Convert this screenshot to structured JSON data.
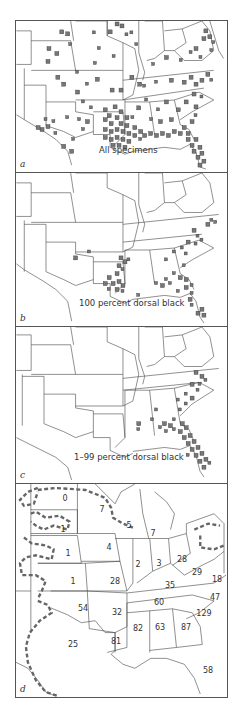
{
  "figure": {
    "colors": {
      "border": "#555555",
      "state_line": "#444444",
      "marker_fill": "#777777",
      "marker_stroke": "#333333",
      "range_dash": "#666666",
      "background": "#ffffff"
    },
    "panels": [
      {
        "letter": "a",
        "caption": "All specimens"
      },
      {
        "letter": "b",
        "caption": "100 percent dorsal black"
      },
      {
        "letter": "c",
        "caption": "1–99 percent dorsal black"
      },
      {
        "letter": "d",
        "caption": ""
      }
    ],
    "state_counts": [
      {
        "state": "ND",
        "value": "0",
        "x": 49,
        "y": 14
      },
      {
        "state": "MN",
        "value": "7",
        "x": 86,
        "y": 25
      },
      {
        "state": "WI",
        "value": "5",
        "x": 113,
        "y": 41
      },
      {
        "state": "MI",
        "value": "7",
        "x": 137,
        "y": 49
      },
      {
        "state": "SD",
        "value": "1",
        "x": 47,
        "y": 45
      },
      {
        "state": "NE",
        "value": "1",
        "x": 52,
        "y": 69
      },
      {
        "state": "IA",
        "value": "4",
        "x": 93,
        "y": 63
      },
      {
        "state": "IL",
        "value": "2",
        "x": 122,
        "y": 80
      },
      {
        "state": "IN",
        "value": "3",
        "x": 143,
        "y": 79
      },
      {
        "state": "OH",
        "value": "28",
        "x": 166,
        "y": 75
      },
      {
        "state": "KS",
        "value": "1",
        "x": 57,
        "y": 97
      },
      {
        "state": "MO",
        "value": "28",
        "x": 99,
        "y": 97
      },
      {
        "state": "WV",
        "value": "29",
        "x": 181,
        "y": 88
      },
      {
        "state": "VA",
        "value": "18",
        "x": 201,
        "y": 95
      },
      {
        "state": "KY",
        "value": "35",
        "x": 154,
        "y": 101
      },
      {
        "state": "TN",
        "value": "60",
        "x": 143,
        "y": 118
      },
      {
        "state": "NC",
        "value": "47",
        "x": 199,
        "y": 113
      },
      {
        "state": "OK",
        "value": "54",
        "x": 67,
        "y": 124
      },
      {
        "state": "AR",
        "value": "32",
        "x": 101,
        "y": 128
      },
      {
        "state": "SC",
        "value": "129",
        "x": 188,
        "y": 129
      },
      {
        "state": "MS",
        "value": "82",
        "x": 122,
        "y": 144
      },
      {
        "state": "AL",
        "value": "63",
        "x": 144,
        "y": 143
      },
      {
        "state": "GA",
        "value": "87",
        "x": 170,
        "y": 143
      },
      {
        "state": "LA",
        "value": "81",
        "x": 100,
        "y": 157
      },
      {
        "state": "TX",
        "value": "25",
        "x": 57,
        "y": 160
      },
      {
        "state": "FL",
        "value": "58",
        "x": 192,
        "y": 186
      }
    ]
  }
}
